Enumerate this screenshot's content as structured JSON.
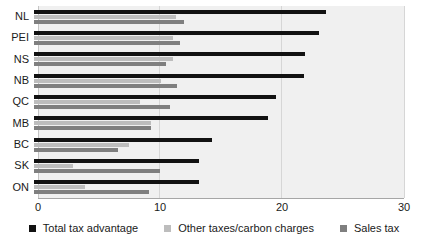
{
  "chart_data": {
    "type": "bar",
    "orientation": "horizontal",
    "title": "",
    "xlabel": "",
    "ylabel": "",
    "categories": [
      "NL",
      "PEI",
      "NS",
      "NB",
      "QC",
      "MB",
      "BC",
      "SK",
      "ON"
    ],
    "series": [
      {
        "name": "Total tax advantage",
        "color": "#121212",
        "values": [
          23.7,
          23.1,
          22.0,
          21.9,
          19.6,
          19.0,
          14.4,
          13.4,
          13.4
        ]
      },
      {
        "name": "Other taxes/carbon charges",
        "color": "#bdbdbd",
        "values": [
          11.5,
          11.3,
          11.3,
          10.3,
          8.6,
          9.5,
          7.7,
          3.2,
          4.1
        ]
      },
      {
        "name": "Sales tax",
        "color": "#7f7f7f",
        "values": [
          12.2,
          11.8,
          10.7,
          11.6,
          11.0,
          9.5,
          6.8,
          10.2,
          9.3
        ]
      }
    ],
    "xlim": [
      0,
      30
    ],
    "x_ticks": [
      0,
      10,
      20,
      30
    ],
    "grid": true,
    "legend_position": "bottom",
    "plot_background": "#f0f0f0",
    "gridline_color": "#d6d6d6"
  }
}
